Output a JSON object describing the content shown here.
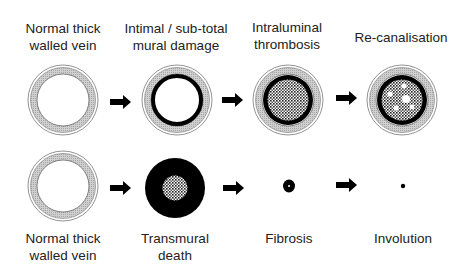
{
  "top_row": {
    "stages": [
      {
        "label_line1": "Normal thick",
        "label_line2": "walled vein",
        "icon": "normal-vein"
      },
      {
        "label_line1": "Intimal / sub-total",
        "label_line2": "mural damage",
        "icon": "intimal-damage"
      },
      {
        "label_line1": "Intraluminal",
        "label_line2": "thrombosis",
        "icon": "thrombosis"
      },
      {
        "label_line1": "Re-canalisation",
        "label_line2": "",
        "icon": "recanalisation"
      }
    ]
  },
  "bottom_row": {
    "stages": [
      {
        "label_line1": "Normal thick",
        "label_line2": "walled vein",
        "icon": "normal-vein"
      },
      {
        "label_line1": "Transmural",
        "label_line2": "death",
        "icon": "transmural-death"
      },
      {
        "label_line1": "Fibrosis",
        "label_line2": "",
        "icon": "fibrosis"
      },
      {
        "label_line1": "Involution",
        "label_line2": "",
        "icon": "involution"
      }
    ]
  },
  "colors": {
    "wall": "#c8c8c8",
    "ink": "#000000",
    "background": "#ffffff"
  }
}
